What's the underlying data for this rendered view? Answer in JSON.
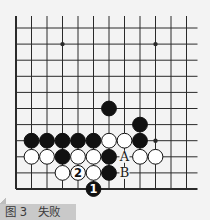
{
  "figure": {
    "caption": "图 3　失败",
    "caption_parts": {
      "label": "图 3",
      "title": "失败"
    }
  },
  "board": {
    "colors": {
      "background": "#f3f3f3",
      "line": "#2a2a2a",
      "black": "#111111",
      "white": "#ffffff"
    },
    "columns": 12,
    "rows": 11,
    "origin": {
      "x": 16,
      "y": 28
    },
    "spacing": {
      "x": 15.5,
      "y": 16.1
    },
    "left_edge": true,
    "bottom_edge": true,
    "top_open": true,
    "right_open": true,
    "star_points": [
      {
        "col": 3,
        "row": 1
      },
      {
        "col": 9,
        "row": 1
      },
      {
        "col": 9,
        "row": 7
      }
    ],
    "stones": [
      {
        "color": "black",
        "col": 6,
        "row": 5
      },
      {
        "color": "black",
        "col": 8,
        "row": 6
      },
      {
        "color": "black",
        "col": 1,
        "row": 7
      },
      {
        "color": "black",
        "col": 2,
        "row": 7
      },
      {
        "color": "black",
        "col": 3,
        "row": 7
      },
      {
        "color": "black",
        "col": 4,
        "row": 7
      },
      {
        "color": "black",
        "col": 5,
        "row": 7
      },
      {
        "color": "white",
        "col": 6,
        "row": 7
      },
      {
        "color": "white",
        "col": 7,
        "row": 7
      },
      {
        "color": "black",
        "col": 8,
        "row": 7
      },
      {
        "color": "white",
        "col": 1,
        "row": 8
      },
      {
        "color": "white",
        "col": 2,
        "row": 8
      },
      {
        "color": "black",
        "col": 3,
        "row": 8
      },
      {
        "color": "white",
        "col": 4,
        "row": 8
      },
      {
        "color": "white",
        "col": 5,
        "row": 8
      },
      {
        "color": "black",
        "col": 6,
        "row": 8
      },
      {
        "color": "white",
        "col": 8,
        "row": 8
      },
      {
        "color": "white",
        "col": 9,
        "row": 8
      },
      {
        "color": "white",
        "col": 3,
        "row": 9
      },
      {
        "color": "white",
        "col": 4,
        "row": 9,
        "label": "2"
      },
      {
        "color": "white",
        "col": 5,
        "row": 9
      },
      {
        "color": "black",
        "col": 6,
        "row": 9
      },
      {
        "color": "black",
        "col": 5,
        "row": 10,
        "label": "1"
      }
    ],
    "markers": [
      {
        "text": "A",
        "col": 7,
        "row": 8
      },
      {
        "text": "B",
        "col": 7,
        "row": 9
      }
    ]
  }
}
